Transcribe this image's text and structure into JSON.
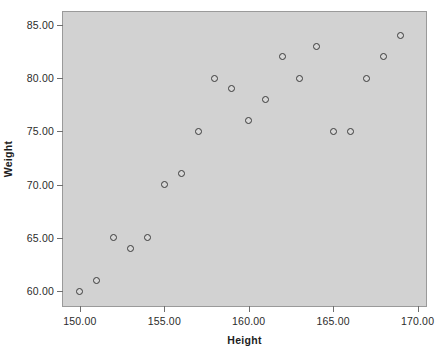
{
  "chart_data": {
    "type": "scatter",
    "title": "",
    "xlabel": "Height",
    "ylabel": "Weight",
    "xlim": [
      149.0,
      170.5
    ],
    "ylim": [
      58.6,
      86.2
    ],
    "grid": false,
    "legend": null,
    "xticks": [
      150,
      155,
      160,
      165,
      170
    ],
    "xtick_labels": [
      "150.00",
      "155.00",
      "160.00",
      "165.00",
      "170.00"
    ],
    "yticks": [
      60,
      65,
      70,
      75,
      80,
      85
    ],
    "ytick_labels": [
      "60.00",
      "65.00",
      "70.00",
      "75.00",
      "80.00",
      "85.00"
    ],
    "marker": "open-circle",
    "marker_edge_color": "#3a3a3a",
    "marker_face_color": "#d8d8d8",
    "plot_background_color": "#d2d2d2",
    "figure_background_color": "#ffffff",
    "axis_border_color": "#9a9a9a",
    "points": [
      {
        "x": 150,
        "y": 60
      },
      {
        "x": 151,
        "y": 61
      },
      {
        "x": 152,
        "y": 65
      },
      {
        "x": 153,
        "y": 64
      },
      {
        "x": 154,
        "y": 65
      },
      {
        "x": 155,
        "y": 70
      },
      {
        "x": 156,
        "y": 71
      },
      {
        "x": 157,
        "y": 75
      },
      {
        "x": 158,
        "y": 80
      },
      {
        "x": 159,
        "y": 79
      },
      {
        "x": 160,
        "y": 76
      },
      {
        "x": 161,
        "y": 78
      },
      {
        "x": 162,
        "y": 82
      },
      {
        "x": 163,
        "y": 80
      },
      {
        "x": 164,
        "y": 83
      },
      {
        "x": 165,
        "y": 75
      },
      {
        "x": 166,
        "y": 75
      },
      {
        "x": 167,
        "y": 80
      },
      {
        "x": 168,
        "y": 82
      },
      {
        "x": 169,
        "y": 84
      }
    ]
  }
}
